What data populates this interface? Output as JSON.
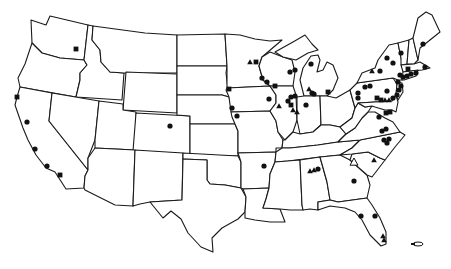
{
  "map": {
    "title": "",
    "region": "United States (contiguous)",
    "background": "#ffffff",
    "line_color": "#1a1a1a",
    "marker_color": "#111111",
    "legend": {
      "circle": "circle-marker",
      "square": "square-marker",
      "triangle": "triangle-marker"
    },
    "markers": [
      {
        "type": "square",
        "x": 76,
        "y": 49,
        "state": "WA"
      },
      {
        "type": "square",
        "x": 17,
        "y": 97,
        "state": "CA"
      },
      {
        "type": "circle",
        "x": 27,
        "y": 122,
        "state": "CA"
      },
      {
        "type": "circle",
        "x": 35,
        "y": 149,
        "state": "CA"
      },
      {
        "type": "circle",
        "x": 47,
        "y": 166,
        "state": "CA"
      },
      {
        "type": "square",
        "x": 60,
        "y": 175,
        "state": "CA"
      },
      {
        "type": "circle",
        "x": 170,
        "y": 126,
        "state": "CO"
      },
      {
        "type": "square",
        "x": 229,
        "y": 89,
        "state": "NE"
      },
      {
        "type": "circle",
        "x": 232,
        "y": 108,
        "state": "KS/MO"
      },
      {
        "type": "circle",
        "x": 237,
        "y": 116,
        "state": "MO"
      },
      {
        "type": "triangle",
        "x": 250,
        "y": 62,
        "state": "MN"
      },
      {
        "type": "square",
        "x": 256,
        "y": 62,
        "state": "MN"
      },
      {
        "type": "circle",
        "x": 262,
        "y": 78,
        "state": "WI"
      },
      {
        "type": "circle",
        "x": 267,
        "y": 82,
        "state": "WI"
      },
      {
        "type": "square",
        "x": 275,
        "y": 86,
        "state": "WI"
      },
      {
        "type": "circle",
        "x": 269,
        "y": 99,
        "state": "IA"
      },
      {
        "type": "circle",
        "x": 290,
        "y": 72,
        "state": "WI"
      },
      {
        "type": "circle",
        "x": 295,
        "y": 70,
        "state": "WI"
      },
      {
        "type": "circle",
        "x": 291,
        "y": 97,
        "state": "IL"
      },
      {
        "type": "circle",
        "x": 295,
        "y": 96,
        "state": "IL"
      },
      {
        "type": "square",
        "x": 291,
        "y": 105,
        "state": "IL"
      },
      {
        "type": "triangle",
        "x": 279,
        "y": 106,
        "state": "IL"
      },
      {
        "type": "triangle",
        "x": 293,
        "y": 110,
        "state": "IL"
      },
      {
        "type": "triangle",
        "x": 297,
        "y": 112,
        "state": "IL"
      },
      {
        "type": "circle",
        "x": 311,
        "y": 64,
        "state": "MI"
      },
      {
        "type": "triangle",
        "x": 309,
        "y": 89,
        "state": "MI"
      },
      {
        "type": "circle",
        "x": 312,
        "y": 93,
        "state": "MI"
      },
      {
        "type": "circle",
        "x": 314,
        "y": 94,
        "state": "MI"
      },
      {
        "type": "square",
        "x": 328,
        "y": 92,
        "state": "OH"
      },
      {
        "type": "circle",
        "x": 306,
        "y": 105,
        "state": "IN"
      },
      {
        "type": "circle",
        "x": 288,
        "y": 101,
        "state": "IL"
      },
      {
        "type": "triangle",
        "x": 372,
        "y": 71,
        "state": "NY"
      },
      {
        "type": "circle",
        "x": 380,
        "y": 71,
        "state": "NY"
      },
      {
        "type": "circle",
        "x": 387,
        "y": 58,
        "state": "NY"
      },
      {
        "type": "circle",
        "x": 393,
        "y": 63,
        "state": "NY"
      },
      {
        "type": "circle",
        "x": 401,
        "y": 53,
        "state": "VT"
      },
      {
        "type": "circle",
        "x": 423,
        "y": 44,
        "state": "ME"
      },
      {
        "type": "square",
        "x": 408,
        "y": 69,
        "state": "MA"
      },
      {
        "type": "circle",
        "x": 425,
        "y": 67,
        "state": "MA"
      },
      {
        "type": "circle",
        "x": 400,
        "y": 75,
        "state": "NY"
      },
      {
        "type": "circle",
        "x": 403,
        "y": 77,
        "state": "CT"
      },
      {
        "type": "circle",
        "x": 407,
        "y": 76,
        "state": "CT"
      },
      {
        "type": "circle",
        "x": 411,
        "y": 74,
        "state": "RI"
      },
      {
        "type": "circle",
        "x": 416,
        "y": 73,
        "state": "MA"
      },
      {
        "type": "circle",
        "x": 398,
        "y": 82,
        "state": "NJ"
      },
      {
        "type": "circle",
        "x": 401,
        "y": 86,
        "state": "NJ"
      },
      {
        "type": "circle",
        "x": 399,
        "y": 90,
        "state": "NJ"
      },
      {
        "type": "circle",
        "x": 397,
        "y": 95,
        "state": "NJ"
      },
      {
        "type": "circle",
        "x": 365,
        "y": 87,
        "state": "PA"
      },
      {
        "type": "circle",
        "x": 370,
        "y": 86,
        "state": "PA"
      },
      {
        "type": "circle",
        "x": 358,
        "y": 93,
        "state": "PA"
      },
      {
        "type": "circle",
        "x": 358,
        "y": 98,
        "state": "PA"
      },
      {
        "type": "circle",
        "x": 387,
        "y": 91,
        "state": "PA"
      },
      {
        "type": "square",
        "x": 377,
        "y": 98,
        "state": "PA"
      },
      {
        "type": "square",
        "x": 381,
        "y": 100,
        "state": "PA"
      },
      {
        "type": "triangle",
        "x": 385,
        "y": 100,
        "state": "PA"
      },
      {
        "type": "triangle",
        "x": 389,
        "y": 100,
        "state": "PA"
      },
      {
        "type": "circle",
        "x": 393,
        "y": 98,
        "state": "DE"
      },
      {
        "type": "circle",
        "x": 379,
        "y": 117,
        "state": "VA"
      },
      {
        "type": "square",
        "x": 386,
        "y": 113,
        "state": "MD"
      },
      {
        "type": "square",
        "x": 390,
        "y": 112,
        "state": "MD"
      },
      {
        "type": "circle",
        "x": 382,
        "y": 131,
        "state": "VA"
      },
      {
        "type": "circle",
        "x": 386,
        "y": 129,
        "state": "VA"
      },
      {
        "type": "circle",
        "x": 384,
        "y": 140,
        "state": "NC"
      },
      {
        "type": "circle",
        "x": 389,
        "y": 139,
        "state": "NC"
      },
      {
        "type": "circle",
        "x": 387,
        "y": 143,
        "state": "NC"
      },
      {
        "type": "circle",
        "x": 264,
        "y": 166,
        "state": "AR"
      },
      {
        "type": "triangle",
        "x": 310,
        "y": 171,
        "state": "AL"
      },
      {
        "type": "triangle",
        "x": 314,
        "y": 170,
        "state": "AL"
      },
      {
        "type": "circle",
        "x": 318,
        "y": 169,
        "state": "AL"
      },
      {
        "type": "triangle-open",
        "x": 354,
        "y": 162,
        "state": "SC"
      },
      {
        "type": "triangle",
        "x": 374,
        "y": 160,
        "state": "SC"
      },
      {
        "type": "circle",
        "x": 354,
        "y": 181,
        "state": "GA"
      },
      {
        "type": "circle",
        "x": 361,
        "y": 216,
        "state": "FL"
      },
      {
        "type": "circle",
        "x": 375,
        "y": 216,
        "state": "FL"
      },
      {
        "type": "triangle",
        "x": 383,
        "y": 236,
        "state": "FL"
      },
      {
        "type": "triangle",
        "x": 384,
        "y": 240,
        "state": "FL"
      }
    ],
    "inset": {
      "name": "puerto-rico-inset",
      "x": 422,
      "y": 245
    }
  }
}
